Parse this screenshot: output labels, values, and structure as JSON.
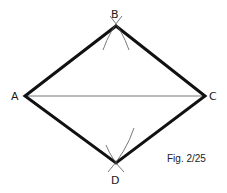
{
  "diagram": {
    "caption": "Fig. 2/25",
    "vertices": [
      {
        "label": "A",
        "x": 25,
        "y": 96
      },
      {
        "label": "B",
        "x": 116,
        "y": 26
      },
      {
        "label": "C",
        "x": 205,
        "y": 96
      },
      {
        "label": "D",
        "x": 116,
        "y": 163
      }
    ],
    "colors": {
      "stroke": "#111111",
      "thin": "#555555",
      "background": "#ffffff"
    }
  }
}
